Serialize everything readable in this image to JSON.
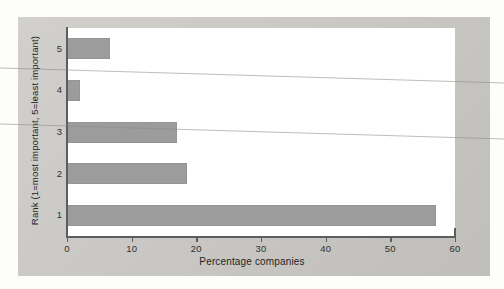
{
  "chart_data": {
    "type": "bar",
    "orientation": "horizontal",
    "title": "",
    "xlabel": "Percentage companies",
    "ylabel": "Rank (1=most important, 5=least important)",
    "categories": [
      "1",
      "2",
      "3",
      "4",
      "5"
    ],
    "values": [
      57,
      18.5,
      17,
      2,
      6.7
    ],
    "xlim": [
      0,
      60
    ],
    "xticks": [
      "0",
      "10",
      "20",
      "30",
      "40",
      "50",
      "60"
    ],
    "yticks": [
      "5",
      "4",
      "3",
      "2",
      "1"
    ],
    "grid": false,
    "legend": null,
    "bar_color": "#9c9c9c",
    "axis_color": "#5d5d5d",
    "plot_background": "#ffffff",
    "page_background": "#c9c7c3"
  },
  "figure": {
    "xlabel": "Percentage companies",
    "ylabel": "Rank (1=most important, 5=least important)"
  }
}
